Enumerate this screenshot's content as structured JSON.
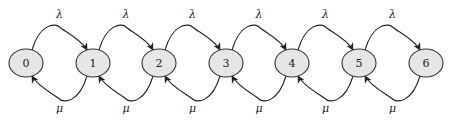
{
  "diagram": {
    "type": "birth-death-chain",
    "node_fill": "#e6e6e6",
    "node_stroke": "#333333",
    "edge_color": "#222222",
    "nodes": [
      {
        "id": 0,
        "label": "0",
        "cx": 26
      },
      {
        "id": 1,
        "label": "1",
        "cx": 93
      },
      {
        "id": 2,
        "label": "2",
        "cx": 159
      },
      {
        "id": 3,
        "label": "3",
        "cx": 226
      },
      {
        "id": 4,
        "label": "4",
        "cx": 292
      },
      {
        "id": 5,
        "label": "5",
        "cx": 359
      },
      {
        "id": 6,
        "label": "6",
        "cx": 426
      }
    ],
    "forward_edges": [
      {
        "from": 0,
        "to": 1,
        "label": "λ"
      },
      {
        "from": 1,
        "to": 2,
        "label": "λ"
      },
      {
        "from": 2,
        "to": 3,
        "label": "λ"
      },
      {
        "from": 3,
        "to": 4,
        "label": "λ"
      },
      {
        "from": 4,
        "to": 5,
        "label": "λ"
      },
      {
        "from": 5,
        "to": 6,
        "label": "λ"
      }
    ],
    "backward_edges": [
      {
        "from": 1,
        "to": 0,
        "label": "μ"
      },
      {
        "from": 2,
        "to": 1,
        "label": "μ"
      },
      {
        "from": 3,
        "to": 2,
        "label": "μ"
      },
      {
        "from": 4,
        "to": 3,
        "label": "μ"
      },
      {
        "from": 5,
        "to": 4,
        "label": "μ"
      },
      {
        "from": 6,
        "to": 5,
        "label": "μ"
      }
    ]
  }
}
